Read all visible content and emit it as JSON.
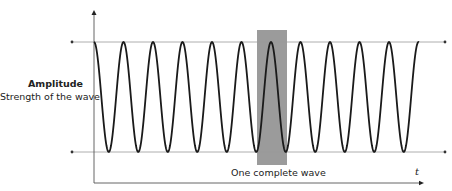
{
  "labels": {
    "amplitude_title": "Amplitude",
    "amplitude_subtitle": "Strength of the wave",
    "highlight_caption": "One complete wave",
    "x_axis_symbol": "t"
  },
  "colors": {
    "wave": "#1a1a1a",
    "axis": "#555555",
    "guide_lines": "#9a9a9a",
    "highlight": "#9b9b9b"
  },
  "geometry": {
    "axis_origin_x": 94,
    "axis_top_y": 10,
    "axis_bottom_y": 183,
    "x_axis_end_x": 424,
    "top_line_y": 42,
    "bottom_line_y": 152,
    "guide_left_x": 72,
    "guide_right_x": 445,
    "wave_start_x": 94,
    "wave_end_x": 419,
    "period_px": 29.5,
    "highlight": {
      "x": 257,
      "y": 30,
      "width": 30,
      "height": 135
    }
  }
}
